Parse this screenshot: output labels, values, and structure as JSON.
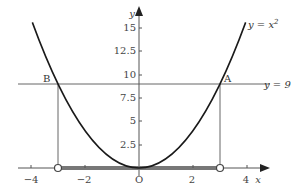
{
  "diagram": {
    "curve_label_prefix": "y = x",
    "curve_label_sup": "2",
    "line_label": "y = 9",
    "point_A": "A",
    "point_B": "B",
    "origin": "O",
    "x_axis_label": "x",
    "y_axis_label": "y",
    "x_ticks": [
      {
        "value": -4,
        "label": "−4"
      },
      {
        "value": -2,
        "label": "−2"
      },
      {
        "value": 2,
        "label": "2"
      },
      {
        "value": 4,
        "label": "4"
      }
    ],
    "y_ticks": [
      {
        "value": 2.5,
        "label": "2.5"
      },
      {
        "value": 5,
        "label": "5"
      },
      {
        "value": 7.5,
        "label": "7.5"
      },
      {
        "value": 10,
        "label": "10"
      },
      {
        "value": 12.5,
        "label": "12.5"
      },
      {
        "value": 15,
        "label": "15"
      }
    ],
    "highlighted_interval": {
      "from": -3,
      "to": 3,
      "open_endpoints": true
    },
    "intersections": [
      {
        "name": "A",
        "x": 3,
        "y": 9
      },
      {
        "name": "B",
        "x": -3,
        "y": 9
      }
    ],
    "colors": {
      "curve": "#1a1a1a",
      "axis": "#555555",
      "line": "#666666",
      "interval": "#777777"
    }
  }
}
